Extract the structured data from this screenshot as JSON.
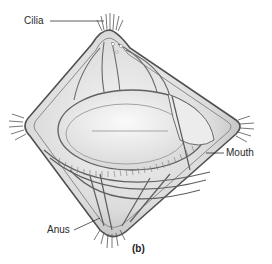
{
  "figure": {
    "panel_label": "(b)",
    "labels": [
      {
        "id": "cilia",
        "text": "Cilia"
      },
      {
        "id": "mouth",
        "text": "Mouth"
      },
      {
        "id": "anus",
        "text": "Anus"
      }
    ],
    "colors": {
      "background": "#ffffff",
      "outline": "#555555",
      "body_fill": "#e4e4e4",
      "inner_fill": "#f2f2f2",
      "shade": "#b8b8b8",
      "label_text": "#2a2a2a"
    }
  }
}
